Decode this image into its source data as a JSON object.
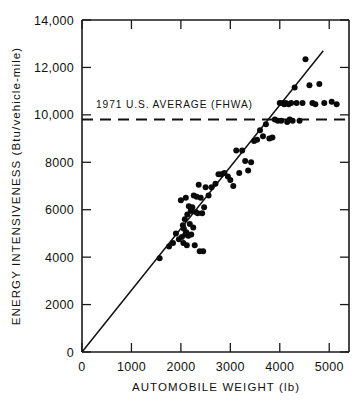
{
  "figure": {
    "background_color": "#ffffff",
    "ink_color": "#111111"
  },
  "chart_data": {
    "type": "scatter",
    "title": "",
    "xlabel": "AUTOMOBILE WEIGHT (lb)",
    "ylabel": "ENERGY INTENSIVENESS (Btu/vehicle-mile)",
    "xlim": [
      0,
      5400
    ],
    "ylim": [
      0,
      14000
    ],
    "grid": false,
    "legend": "none",
    "xticks": [
      0,
      1000,
      2000,
      3000,
      4000,
      5000
    ],
    "xtick_labels": [
      "0",
      "1000",
      "2000",
      "3000",
      "4000",
      "5000"
    ],
    "yticks": [
      0,
      2000,
      4000,
      6000,
      8000,
      10000,
      12000,
      14000
    ],
    "ytick_labels": [
      "0",
      "2000",
      "4000",
      "6000",
      "8000",
      "10,000",
      "12,000",
      "14,000"
    ],
    "series": [
      {
        "name": "automobile models",
        "marker": "filled-circle",
        "marker_color": "#0a0a0a",
        "x": [
          1570,
          1760,
          1840,
          1900,
          1960,
          2000,
          2020,
          2040,
          2050,
          2060,
          2080,
          2090,
          2100,
          2110,
          2120,
          2130,
          2150,
          2160,
          2180,
          2200,
          2210,
          2230,
          2250,
          2260,
          2280,
          2300,
          2320,
          2340,
          2360,
          2380,
          2400,
          2430,
          2450,
          2470,
          2500,
          2560,
          2620,
          2700,
          2760,
          2820,
          2880,
          2950,
          3000,
          3060,
          3120,
          3180,
          3240,
          3300,
          3360,
          3420,
          3480,
          3540,
          3600,
          3660,
          3720,
          3790,
          3850,
          3900,
          3960,
          4000,
          4030,
          4060,
          4090,
          4120,
          4150,
          4180,
          4200,
          4230,
          4260,
          4300,
          4340,
          4400,
          4460,
          4520,
          4600,
          4660,
          4720,
          4800,
          4900,
          5050,
          5150
        ],
        "y": [
          3950,
          4450,
          4600,
          5000,
          4750,
          6400,
          4850,
          5350,
          4600,
          5200,
          5600,
          4950,
          6500,
          5050,
          4500,
          5800,
          4900,
          6150,
          5400,
          5950,
          4950,
          6100,
          5250,
          6600,
          4500,
          5900,
          6550,
          5850,
          7050,
          4250,
          6500,
          5850,
          4250,
          6100,
          6950,
          6600,
          6950,
          7100,
          7500,
          7500,
          7550,
          7400,
          7250,
          7000,
          8500,
          7550,
          8500,
          8050,
          7650,
          8000,
          8900,
          8950,
          9350,
          9100,
          9600,
          9000,
          9050,
          9800,
          9750,
          10500,
          9750,
          10500,
          10450,
          10500,
          9700,
          10450,
          9800,
          10500,
          9750,
          11150,
          10500,
          9750,
          10500,
          12350,
          11250,
          10500,
          10450,
          11300,
          10500,
          10550,
          10450
        ]
      }
    ],
    "fit_line": {
      "name": "regression-line",
      "x_start": 0,
      "y_start": 0,
      "x_end": 4880,
      "y_end": 12700
    },
    "reference_line": {
      "name": "1971-us-average",
      "label": "1971 U.S. AVERAGE (FHWA)",
      "value": 9800,
      "style": "dashed",
      "orientation": "horizontal"
    }
  }
}
